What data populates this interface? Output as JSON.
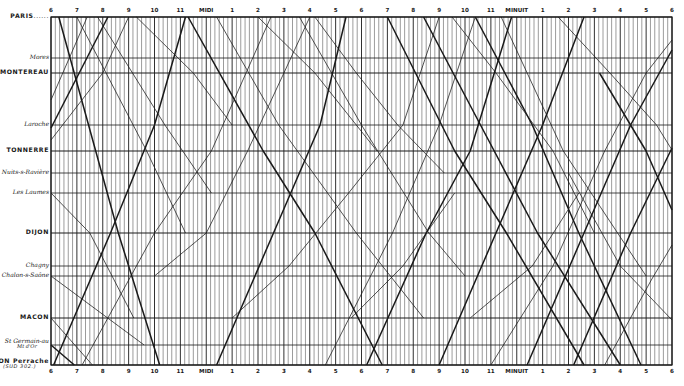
{
  "chart_data": {
    "type": "line",
    "title": "",
    "subtitle": "Graphical train timetable (Paris – Lyon)",
    "xlabel": "",
    "ylabel": "",
    "x_axis": {
      "start_hour": 6,
      "end_hour": 30,
      "px_left": 51,
      "px_right": 672,
      "minor_ticks_per_hour": 6,
      "tick_labels": [
        "6",
        "7",
        "8",
        "9",
        "10",
        "11",
        "MIDI",
        "1",
        "2",
        "3",
        "4",
        "5",
        "6",
        "7",
        "8",
        "9",
        "10",
        "11",
        "MINUIT",
        "1",
        "2",
        "3",
        "4",
        "5",
        "6"
      ]
    },
    "stations": [
      {
        "id": "paris",
        "label": "PARIS",
        "suffix": "......",
        "style": "caps",
        "y": 17,
        "major": true
      },
      {
        "id": "mores",
        "label": "Mores",
        "style": "ital",
        "y": 58,
        "major": false
      },
      {
        "id": "montereau",
        "label": "MONTEREAU",
        "style": "caps",
        "y": 73,
        "major": true
      },
      {
        "id": "laroche",
        "label": "Laroche",
        "style": "ital",
        "y": 125,
        "major": false
      },
      {
        "id": "tonnerre",
        "label": "TONNERRE",
        "style": "caps",
        "y": 151,
        "major": true
      },
      {
        "id": "nuits",
        "label": "Nuits-s-Ravière",
        "style": "ital",
        "y": 173,
        "major": false
      },
      {
        "id": "laumes",
        "label": "Les Laumes",
        "style": "ital",
        "y": 193,
        "major": false
      },
      {
        "id": "dijon",
        "label": "DIJON",
        "style": "caps",
        "y": 233,
        "major": true
      },
      {
        "id": "chagny",
        "label": "Chagny",
        "style": "ital",
        "y": 266,
        "major": false
      },
      {
        "id": "chalon",
        "label": "Chalon-s-Saône",
        "style": "ital",
        "y": 276,
        "major": false
      },
      {
        "id": "macon",
        "label": "MACON",
        "style": "caps",
        "y": 318,
        "major": true
      },
      {
        "id": "stgermain",
        "label": "St Germain-au-Mt-d'Or",
        "label_line1": "St Germain-au",
        "label_line2": "Mt d'Or",
        "style": "ital",
        "y": 345,
        "major": false
      },
      {
        "id": "lyon",
        "label": "LYON Perrache",
        "label_line1": "LYON Perrache",
        "label_line2": "(SUD 302.)",
        "style": "caps",
        "y": 365,
        "major": true
      }
    ],
    "series": [
      {
        "name": "southbound-express-1",
        "weight": "heavy",
        "points": [
          [
            6.3,
            17
          ],
          [
            8.6,
            233
          ],
          [
            10.2,
            365
          ]
        ]
      },
      {
        "name": "southbound-1",
        "weight": "light",
        "points": [
          [
            7.0,
            17
          ],
          [
            9.7,
            151
          ],
          [
            11.2,
            233
          ]
        ]
      },
      {
        "name": "southbound-2",
        "weight": "light",
        "points": [
          [
            7.8,
            17
          ],
          [
            10.4,
            125
          ],
          [
            12.2,
            193
          ]
        ]
      },
      {
        "name": "southbound-3",
        "weight": "light",
        "points": [
          [
            9.3,
            17
          ],
          [
            11.5,
            73
          ],
          [
            13.0,
            125
          ]
        ]
      },
      {
        "name": "southbound-express-2",
        "weight": "heavy",
        "points": [
          [
            11.3,
            17
          ],
          [
            14.2,
            151
          ],
          [
            16.2,
            233
          ],
          [
            18.8,
            365
          ]
        ]
      },
      {
        "name": "southbound-4",
        "weight": "light",
        "points": [
          [
            12.4,
            17
          ],
          [
            14.8,
            125
          ],
          [
            17.8,
            233
          ],
          [
            20.4,
            318
          ]
        ]
      },
      {
        "name": "southbound-5",
        "weight": "light",
        "points": [
          [
            14.0,
            17
          ],
          [
            16.2,
            73
          ],
          [
            18.6,
            151
          ]
        ]
      },
      {
        "name": "southbound-6",
        "weight": "light",
        "points": [
          [
            15.6,
            17
          ],
          [
            18.0,
            125
          ],
          [
            20.6,
            233
          ],
          [
            22.0,
            276
          ]
        ]
      },
      {
        "name": "southbound-express-3",
        "weight": "heavy",
        "points": [
          [
            19.0,
            17
          ],
          [
            21.6,
            151
          ],
          [
            23.6,
            233
          ],
          [
            26.6,
            365
          ]
        ]
      },
      {
        "name": "southbound-express-4",
        "weight": "heavy",
        "points": [
          [
            20.4,
            17
          ],
          [
            22.6,
            125
          ],
          [
            24.8,
            233
          ],
          [
            28.0,
            365
          ]
        ]
      },
      {
        "name": "southbound-7",
        "weight": "light",
        "points": [
          [
            21.5,
            17
          ],
          [
            23.2,
            73
          ],
          [
            25.4,
            151
          ],
          [
            27.0,
            233
          ]
        ]
      },
      {
        "name": "southbound-express-5",
        "weight": "heavy",
        "points": [
          [
            22.4,
            17
          ],
          [
            24.6,
            125
          ],
          [
            26.4,
            233
          ],
          [
            28.8,
            365
          ]
        ]
      },
      {
        "name": "southbound-8",
        "weight": "light",
        "points": [
          [
            23.4,
            17
          ],
          [
            25.8,
            151
          ],
          [
            29.0,
            276
          ]
        ]
      },
      {
        "name": "southbound-9",
        "weight": "light",
        "points": [
          [
            6.0,
            318
          ],
          [
            7.6,
            365
          ]
        ]
      },
      {
        "name": "southbound-10",
        "weight": "light",
        "points": [
          [
            6.0,
            193
          ],
          [
            7.5,
            233
          ],
          [
            9.2,
            318
          ]
        ]
      },
      {
        "name": "southbound-11",
        "weight": "light",
        "points": [
          [
            6.0,
            276
          ],
          [
            9.6,
            345
          ]
        ]
      },
      {
        "name": "southbound-12",
        "weight": "heavy",
        "points": [
          [
            6.0,
            345
          ],
          [
            6.9,
            365
          ]
        ]
      },
      {
        "name": "northbound-express-1",
        "weight": "heavy",
        "points": [
          [
            6.1,
            365
          ],
          [
            8.3,
            233
          ],
          [
            10.0,
            125
          ],
          [
            11.2,
            17
          ]
        ]
      },
      {
        "name": "northbound-1",
        "weight": "light",
        "points": [
          [
            6.0,
            140
          ],
          [
            8.0,
            73
          ],
          [
            9.0,
            17
          ]
        ]
      },
      {
        "name": "northbound-2",
        "weight": "light",
        "points": [
          [
            6.0,
            100
          ],
          [
            7.4,
            17
          ]
        ]
      },
      {
        "name": "northbound-express-2",
        "weight": "heavy",
        "points": [
          [
            6.0,
            128
          ],
          [
            8.2,
            17
          ]
        ]
      },
      {
        "name": "northbound-3",
        "weight": "light",
        "points": [
          [
            7.2,
            365
          ],
          [
            10.0,
            233
          ],
          [
            12.2,
            151
          ],
          [
            14.5,
            17
          ]
        ]
      },
      {
        "name": "northbound-4",
        "weight": "light",
        "points": [
          [
            10.0,
            276
          ],
          [
            12.0,
            233
          ],
          [
            13.6,
            151
          ],
          [
            15.0,
            73
          ],
          [
            16.0,
            17
          ]
        ]
      },
      {
        "name": "northbound-express-3",
        "weight": "heavy",
        "points": [
          [
            12.4,
            365
          ],
          [
            14.6,
            233
          ],
          [
            16.4,
            125
          ],
          [
            17.4,
            17
          ]
        ]
      },
      {
        "name": "northbound-5",
        "weight": "light",
        "points": [
          [
            13.0,
            318
          ],
          [
            15.2,
            266
          ],
          [
            17.5,
            193
          ],
          [
            19.6,
            125
          ],
          [
            21.0,
            17
          ]
        ]
      },
      {
        "name": "northbound-6",
        "weight": "light",
        "points": [
          [
            16.6,
            365
          ],
          [
            19.2,
            233
          ],
          [
            21.0,
            125
          ],
          [
            22.4,
            17
          ]
        ]
      },
      {
        "name": "northbound-express-4",
        "weight": "heavy",
        "points": [
          [
            18.2,
            365
          ],
          [
            20.5,
            233
          ],
          [
            22.2,
            151
          ],
          [
            23.8,
            17
          ]
        ]
      },
      {
        "name": "northbound-express-5",
        "weight": "heavy",
        "points": [
          [
            21.0,
            365
          ],
          [
            23.2,
            233
          ],
          [
            25.0,
            125
          ],
          [
            26.6,
            17
          ]
        ]
      },
      {
        "name": "northbound-7",
        "weight": "light",
        "points": [
          [
            23.0,
            365
          ],
          [
            25.4,
            266
          ],
          [
            27.4,
            151
          ],
          [
            29.0,
            73
          ],
          [
            30.0,
            40
          ]
        ]
      },
      {
        "name": "northbound-express-6",
        "weight": "heavy",
        "points": [
          [
            24.4,
            365
          ],
          [
            26.6,
            233
          ],
          [
            28.4,
            125
          ],
          [
            30.0,
            50
          ]
        ]
      },
      {
        "name": "northbound-express-7",
        "weight": "heavy",
        "points": [
          [
            26.2,
            365
          ],
          [
            28.4,
            233
          ],
          [
            30.0,
            148
          ]
        ]
      },
      {
        "name": "northbound-8",
        "weight": "light",
        "points": [
          [
            27.4,
            365
          ],
          [
            29.2,
            280
          ],
          [
            30.0,
            245
          ]
        ]
      },
      {
        "name": "southbound-13",
        "weight": "light",
        "points": [
          [
            16.2,
            17
          ],
          [
            17.8,
            73
          ],
          [
            19.4,
            125
          ],
          [
            21.2,
            173
          ]
        ]
      },
      {
        "name": "southbound-14",
        "weight": "light",
        "points": [
          [
            25.6,
            17
          ],
          [
            27.6,
            73
          ],
          [
            29.4,
            125
          ],
          [
            30.0,
            150
          ]
        ]
      },
      {
        "name": "southbound-express-6",
        "weight": "heavy",
        "points": [
          [
            27.2,
            73
          ],
          [
            29.0,
            151
          ],
          [
            30.0,
            210
          ]
        ]
      },
      {
        "name": "southbound-15",
        "weight": "light",
        "points": [
          [
            26.0,
            173
          ],
          [
            28.0,
            266
          ],
          [
            30.0,
            320
          ]
        ]
      },
      {
        "name": "northbound-9",
        "weight": "light",
        "points": [
          [
            17.6,
            318
          ],
          [
            19.6,
            266
          ],
          [
            21.6,
            193
          ]
        ]
      },
      {
        "name": "northbound-10",
        "weight": "light",
        "points": [
          [
            22.2,
            318
          ],
          [
            24.6,
            266
          ],
          [
            26.4,
            193
          ]
        ]
      }
    ],
    "colors": {
      "ink": "#1a1a1a",
      "grid_minor": "#4a4a4a",
      "paper": "#ffffff"
    },
    "grid": true,
    "legend": "none"
  }
}
